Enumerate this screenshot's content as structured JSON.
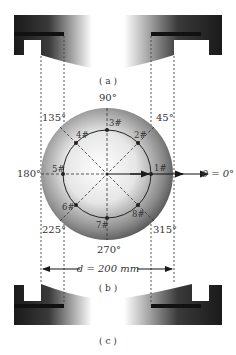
{
  "panels": {
    "a_label": "( a )",
    "b_label": "( b )",
    "c_label": "( c )"
  },
  "angles": {
    "a0": "θ = 0°",
    "a45": "45°",
    "a90": "90°",
    "a135": "135°",
    "a180": "180°",
    "a225": "225°",
    "a270": "270°",
    "a315": "315°"
  },
  "points": [
    {
      "id": "1#",
      "angle": 0
    },
    {
      "id": "2#",
      "angle": 45
    },
    {
      "id": "3#",
      "angle": 90
    },
    {
      "id": "4#",
      "angle": 135
    },
    {
      "id": "5#",
      "angle": 180
    },
    {
      "id": "6#",
      "angle": 225
    },
    {
      "id": "7#",
      "angle": 270
    },
    {
      "id": "8#",
      "angle": 315
    }
  ],
  "dimension": {
    "label": "d = 200 mm"
  },
  "colors": {
    "dark": "#1a1a1a",
    "line": "#333333",
    "dash": "#555555"
  }
}
